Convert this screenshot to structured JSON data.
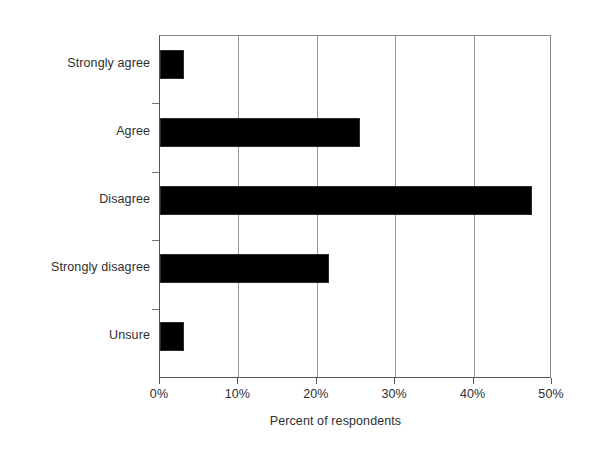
{
  "chart_data": {
    "type": "bar",
    "orientation": "horizontal",
    "title": "",
    "subtitle": "",
    "xlabel": "Percent of respondents",
    "ylabel": "",
    "categories": [
      "Strongly agree",
      "Agree",
      "Disagree",
      "Strongly disagree",
      "Unsure"
    ],
    "values": [
      3,
      25.5,
      47.5,
      21.5,
      3
    ],
    "xlim": [
      0,
      50
    ],
    "xtick_values": [
      0,
      10,
      20,
      30,
      40,
      50
    ],
    "xtick_labels": [
      "0%",
      "10%",
      "20%",
      "30%",
      "40%",
      "50%"
    ],
    "grid": "vertical",
    "legend": "none",
    "bar_color": "#000000",
    "series": [
      {
        "name": "Percent of respondents",
        "values": [
          3,
          25.5,
          47.5,
          21.5,
          3
        ]
      }
    ]
  },
  "axis": {
    "x_title": "Percent of respondents",
    "tick_0": "0%",
    "tick_1": "10%",
    "tick_2": "20%",
    "tick_3": "30%",
    "tick_4": "40%",
    "tick_5": "50%"
  },
  "categories": {
    "c0": "Strongly agree",
    "c1": "Agree",
    "c2": "Disagree",
    "c3": "Strongly disagree",
    "c4": "Unsure"
  },
  "colors": {
    "bar": "#000000",
    "gridline": "#9a9a9a",
    "axis": "#555555",
    "text": "#2e2e2e",
    "background": "#ffffff"
  }
}
